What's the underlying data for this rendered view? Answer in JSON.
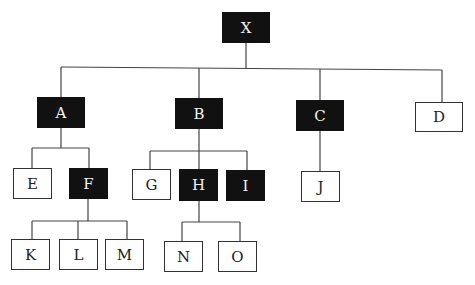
{
  "diagram": {
    "type": "tree",
    "colors": {
      "filled": "#111111",
      "empty": "#ffffff",
      "line": "#444444"
    },
    "nodes": [
      {
        "id": "X",
        "label": "X",
        "filled": true,
        "x": 222,
        "y": 12,
        "w": 48,
        "h": 31
      },
      {
        "id": "A",
        "label": "A",
        "filled": true,
        "x": 37,
        "y": 97,
        "w": 48,
        "h": 31
      },
      {
        "id": "B",
        "label": "B",
        "filled": true,
        "x": 175,
        "y": 98,
        "w": 48,
        "h": 31
      },
      {
        "id": "C",
        "label": "C",
        "filled": true,
        "x": 296,
        "y": 100,
        "w": 48,
        "h": 31
      },
      {
        "id": "D",
        "label": "D",
        "filled": false,
        "x": 415,
        "y": 102,
        "w": 48,
        "h": 30
      },
      {
        "id": "E",
        "label": "E",
        "filled": false,
        "x": 13,
        "y": 168,
        "w": 39,
        "h": 31
      },
      {
        "id": "F",
        "label": "F",
        "filled": true,
        "x": 69,
        "y": 168,
        "w": 39,
        "h": 31
      },
      {
        "id": "G",
        "label": "G",
        "filled": false,
        "x": 132,
        "y": 169,
        "w": 39,
        "h": 31
      },
      {
        "id": "H",
        "label": "H",
        "filled": true,
        "x": 179,
        "y": 169,
        "w": 39,
        "h": 32
      },
      {
        "id": "I",
        "label": "I",
        "filled": true,
        "x": 226,
        "y": 170,
        "w": 39,
        "h": 31
      },
      {
        "id": "J",
        "label": "J",
        "filled": false,
        "x": 301,
        "y": 171,
        "w": 39,
        "h": 31
      },
      {
        "id": "K",
        "label": "K",
        "filled": false,
        "x": 11,
        "y": 239,
        "w": 39,
        "h": 31
      },
      {
        "id": "L",
        "label": "L",
        "filled": false,
        "x": 59,
        "y": 239,
        "w": 39,
        "h": 31
      },
      {
        "id": "M",
        "label": "M",
        "filled": false,
        "x": 105,
        "y": 239,
        "w": 39,
        "h": 31
      },
      {
        "id": "N",
        "label": "N",
        "filled": false,
        "x": 164,
        "y": 241,
        "w": 39,
        "h": 31
      },
      {
        "id": "O",
        "label": "O",
        "filled": false,
        "x": 218,
        "y": 241,
        "w": 39,
        "h": 31
      }
    ],
    "edges": [
      [
        "X",
        "A"
      ],
      [
        "X",
        "B"
      ],
      [
        "X",
        "C"
      ],
      [
        "X",
        "D"
      ],
      [
        "A",
        "E"
      ],
      [
        "A",
        "F"
      ],
      [
        "B",
        "G"
      ],
      [
        "B",
        "H"
      ],
      [
        "B",
        "I"
      ],
      [
        "C",
        "J"
      ],
      [
        "F",
        "K"
      ],
      [
        "F",
        "L"
      ],
      [
        "F",
        "M"
      ],
      [
        "H",
        "N"
      ],
      [
        "H",
        "O"
      ]
    ],
    "lines": [
      [
        246,
        43,
        246,
        69
      ],
      [
        61,
        67,
        442,
        70
      ],
      [
        61,
        67,
        61,
        97
      ],
      [
        199,
        68,
        199,
        98
      ],
      [
        320,
        69,
        320,
        100
      ],
      [
        442,
        70,
        442,
        102
      ],
      [
        61,
        128,
        61,
        148
      ],
      [
        32,
        148,
        89,
        148
      ],
      [
        32,
        148,
        32,
        168
      ],
      [
        89,
        148,
        89,
        168
      ],
      [
        199,
        129,
        199,
        151
      ],
      [
        150,
        151,
        247,
        151
      ],
      [
        150,
        151,
        150,
        169
      ],
      [
        199,
        151,
        199,
        169
      ],
      [
        247,
        151,
        247,
        170
      ],
      [
        320,
        131,
        320,
        171
      ],
      [
        88,
        199,
        88,
        221
      ],
      [
        32,
        221,
        127,
        221
      ],
      [
        32,
        221,
        32,
        239
      ],
      [
        78,
        221,
        78,
        239
      ],
      [
        127,
        221,
        127,
        239
      ],
      [
        199,
        201,
        199,
        222
      ],
      [
        182,
        222,
        240,
        222
      ],
      [
        182,
        222,
        182,
        241
      ],
      [
        240,
        222,
        240,
        241
      ]
    ]
  }
}
